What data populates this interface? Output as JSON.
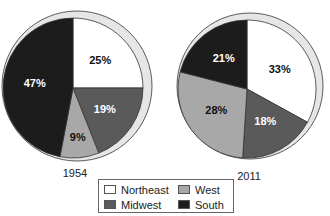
{
  "chart_data": [
    {
      "type": "pie",
      "title": "1954",
      "slices": [
        {
          "label": "Northeast",
          "value": 25,
          "text": "25%"
        },
        {
          "label": "Midwest",
          "value": 19,
          "text": "19%"
        },
        {
          "label": "West",
          "value": 9,
          "text": "9%"
        },
        {
          "label": "South",
          "value": 47,
          "text": "47%"
        }
      ]
    },
    {
      "type": "pie",
      "title": "2011",
      "slices": [
        {
          "label": "Northeast",
          "value": 33,
          "text": "33%"
        },
        {
          "label": "Midwest",
          "value": 18,
          "text": "18%"
        },
        {
          "label": "West",
          "value": 28,
          "text": "28%"
        },
        {
          "label": "South",
          "value": 21,
          "text": "21%"
        }
      ]
    }
  ],
  "legend": [
    {
      "label": "Northeast",
      "color": "#ffffff"
    },
    {
      "label": "West",
      "color": "#a8a8a8"
    },
    {
      "label": "Midwest",
      "color": "#5a5a5a"
    },
    {
      "label": "South",
      "color": "#1c1c1c"
    }
  ],
  "colors": {
    "Northeast": "#ffffff",
    "Midwest": "#5a5a5a",
    "West": "#a8a8a8",
    "South": "#1c1c1c",
    "rim": "#e6e6e6"
  }
}
